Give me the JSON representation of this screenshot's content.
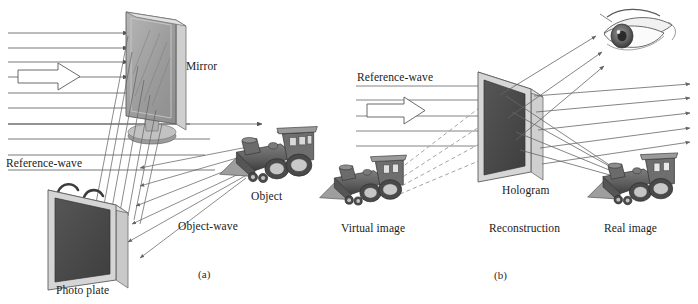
{
  "figure": {
    "title_visible": false,
    "background_color": "#ffffff",
    "ink_color": "#444444",
    "panels": [
      {
        "id": "a",
        "caption": "(a)",
        "caption_x": 198,
        "caption_y": 268,
        "description": "Hologram recording setup",
        "labels": [
          {
            "name": "mirror-label",
            "text": "Mirror",
            "x": 186,
            "y": 60
          },
          {
            "name": "reference-wave-label",
            "text": "Reference-wave",
            "x": 6,
            "y": 157
          },
          {
            "name": "object-label",
            "text": "Object",
            "x": 251,
            "y": 190
          },
          {
            "name": "object-wave-label",
            "text": "Object-wave",
            "x": 178,
            "y": 220
          },
          {
            "name": "photo-plate-label",
            "text": "Photo plate",
            "x": 56,
            "y": 284
          }
        ],
        "elements": [
          {
            "name": "mirror-panel",
            "kind": "tilted-mirror-plate"
          },
          {
            "name": "mirror-stand",
            "kind": "pedestal-stand"
          },
          {
            "name": "photo-plate-panel",
            "kind": "dark-plate-with-handles"
          },
          {
            "name": "locomotive-object",
            "kind": "toy-locomotive"
          },
          {
            "name": "reference-wave-rays",
            "kind": "horizontal-ray-bundle",
            "count": 9
          },
          {
            "name": "reference-wave-block-arrow",
            "kind": "outlined-block-arrow"
          },
          {
            "name": "mirror-reflected-rays",
            "kind": "diagonal-ray-bundle",
            "count": 7
          },
          {
            "name": "object-wave-rays",
            "kind": "diagonal-ray-bundle",
            "count": 6
          }
        ]
      },
      {
        "id": "b",
        "caption": "(b)",
        "caption_x": 494,
        "caption_y": 269,
        "description": "Hologram reconstruction",
        "labels": [
          {
            "name": "reference-wave-label",
            "text": "Reference-wave",
            "x": 357,
            "y": 71
          },
          {
            "name": "hologram-label",
            "text": "Hologram",
            "x": 502,
            "y": 184
          },
          {
            "name": "virtual-image-label",
            "text": "Virtual image",
            "x": 341,
            "y": 222
          },
          {
            "name": "reconstruction-label",
            "text": "Reconstruction",
            "x": 489,
            "y": 222
          },
          {
            "name": "real-image-label",
            "text": "Real image",
            "x": 604,
            "y": 222
          }
        ],
        "elements": [
          {
            "name": "hologram-plate",
            "kind": "dark-plate"
          },
          {
            "name": "virtual-image-locomotive",
            "kind": "toy-locomotive"
          },
          {
            "name": "real-image-locomotive",
            "kind": "toy-locomotive"
          },
          {
            "name": "observer-eye",
            "kind": "human-eye"
          },
          {
            "name": "reference-wave-rays",
            "kind": "horizontal-ray-bundle",
            "count": 5
          },
          {
            "name": "reference-wave-block-arrow",
            "kind": "outlined-block-arrow"
          },
          {
            "name": "virtual-image-dashed-rays",
            "kind": "dashed-ray-bundle",
            "count": 4
          },
          {
            "name": "eye-rays",
            "kind": "diagonal-ray-bundle",
            "count": 3
          },
          {
            "name": "real-image-rays",
            "kind": "diagonal-ray-bundle",
            "count": 4
          },
          {
            "name": "transmitted-rays",
            "kind": "horizontal-ray-bundle",
            "count": 5
          }
        ]
      }
    ],
    "colors": {
      "ray": "#555555",
      "dashed_ray": "#8a8a8a",
      "plate_dark": "#4a4a4a",
      "plate_frame": "#d8d8d8",
      "mirror_face": "#9a9a9a",
      "loco_body": "#5a5a5a",
      "text": "#1a1a1a"
    }
  }
}
